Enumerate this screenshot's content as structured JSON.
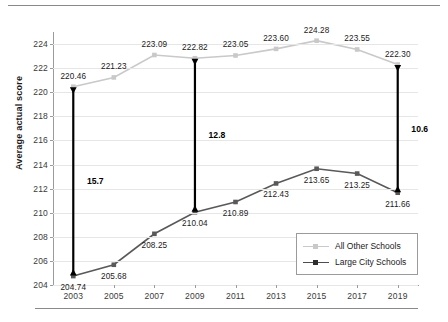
{
  "figure": {
    "clipped_top_text": "",
    "yaxis_title": "Average actual score"
  },
  "legend": {
    "items": [
      {
        "label": "All Other Schools",
        "color": "#c9c9c9",
        "key": "all-other-schools"
      },
      {
        "label": "Large City Schools",
        "color": "#4d4d4d",
        "key": "large-city-schools"
      }
    ]
  },
  "chart_data": {
    "type": "line",
    "title": "",
    "xlabel": "",
    "ylabel": "Average actual score",
    "categories": [
      "2003",
      "2005",
      "2007",
      "2009",
      "2011",
      "2013",
      "2015",
      "2017",
      "2019"
    ],
    "ylim": [
      204,
      225
    ],
    "yticks": [
      204,
      206,
      208,
      210,
      212,
      214,
      216,
      218,
      220,
      222,
      224
    ],
    "grid": true,
    "legend_position": "lower-right",
    "series": [
      {
        "name": "All Other Schools",
        "color": "#c9c9c9",
        "values": [
          220.46,
          221.23,
          223.09,
          222.82,
          223.05,
          223.6,
          224.28,
          223.55,
          222.3
        ],
        "labels": [
          "220.46",
          "221.23",
          "223.09",
          "222.82",
          "223.05",
          "223.60",
          "224.28",
          "223.55",
          "222.30"
        ]
      },
      {
        "name": "Large City Schools",
        "color": "#595959",
        "values": [
          204.74,
          205.68,
          208.25,
          210.04,
          210.89,
          212.43,
          213.65,
          213.25,
          211.66
        ],
        "labels": [
          "204.74",
          "205.68",
          "208.25",
          "210.04",
          "210.89",
          "212.43",
          "213.65",
          "213.25",
          "211.66"
        ]
      }
    ],
    "annotations": [
      {
        "label": "15.7",
        "year": "2003",
        "top": 220.46,
        "bottom": 204.74
      },
      {
        "label": "12.8",
        "year": "2009",
        "top": 222.82,
        "bottom": 210.04
      },
      {
        "label": "10.6",
        "year": "2019",
        "top": 222.3,
        "bottom": 211.66
      }
    ]
  }
}
